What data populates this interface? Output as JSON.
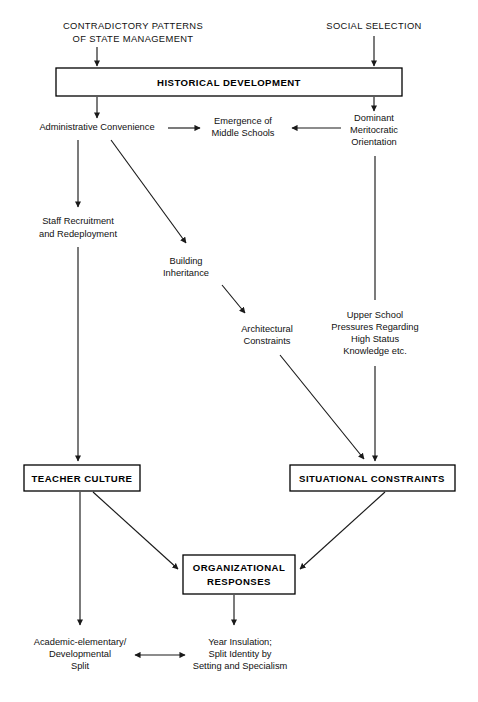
{
  "diagram": {
    "colors": {
      "background": "#ffffff",
      "stroke": "#1a1a1a",
      "text": "#111111"
    },
    "inputs": {
      "contradictory_patterns_line1": "CONTRADICTORY PATTERNS",
      "contradictory_patterns_line2": "OF STATE MANAGEMENT",
      "social_selection": "SOCIAL SELECTION"
    },
    "boxes": {
      "historical_development": "HISTORICAL DEVELOPMENT",
      "teacher_culture": "TEACHER CULTURE",
      "situational_constraints": "SITUATIONAL CONSTRAINTS",
      "organizational_responses_line1": "ORGANIZATIONAL",
      "organizational_responses_line2": "RESPONSES"
    },
    "nodes": {
      "administrative_convenience": "Administrative Convenience",
      "emergence_line1": "Emergence of",
      "emergence_line2": "Middle Schools",
      "dominant_line1": "Dominant",
      "dominant_line2": "Meritocratic",
      "dominant_line3": "Orientation",
      "staff_line1": "Staff Recruitment",
      "staff_line2": "and Redeployment",
      "building_line1": "Building",
      "building_line2": "Inheritance",
      "architectural_line1": "Architectural",
      "architectural_line2": "Constraints",
      "upper_school_line1": "Upper School",
      "upper_school_line2": "Pressures Regarding",
      "upper_school_line3": "High Status",
      "upper_school_line4": "Knowledge etc."
    },
    "outcomes": {
      "left_line1": "Academic-elementary/",
      "left_line2": "Developmental",
      "left_line3": "Split",
      "right_line1": "Year Insulation;",
      "right_line2": "Split Identity by",
      "right_line3": "Setting and Specialism"
    }
  }
}
